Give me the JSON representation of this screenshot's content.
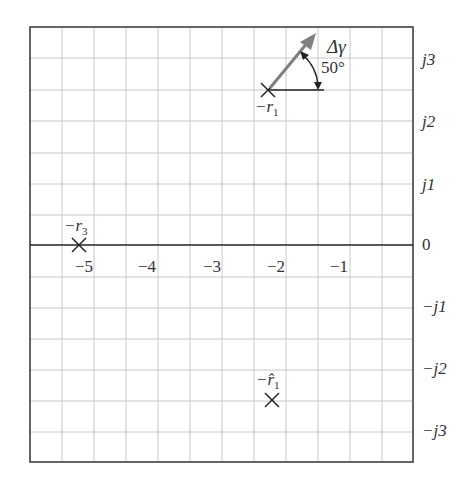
{
  "diagram": {
    "x_tick_labels": [
      "−5",
      "−4",
      "−3",
      "−2",
      "−1"
    ],
    "y_tick_labels": [
      "j3",
      "j2",
      "j1",
      "0",
      "−j1",
      "−j2",
      "−j3"
    ],
    "poles": [
      {
        "name": "-r1",
        "label": "−r",
        "sub": "1",
        "re": -2.25,
        "im": 2.5
      },
      {
        "name": "-r3",
        "label": "−r",
        "sub": "3",
        "re": -5.25,
        "im": 0
      },
      {
        "name": "-r1hat",
        "label": "−r̂",
        "sub": "1",
        "re": -2.2,
        "im": -2.5
      }
    ],
    "arrow_label": "Δγ",
    "angle_label": "50°",
    "colors": {
      "grid": "#c8c8c8",
      "axis": "#222222",
      "arrow": "#808080",
      "frame": "#333333"
    }
  }
}
